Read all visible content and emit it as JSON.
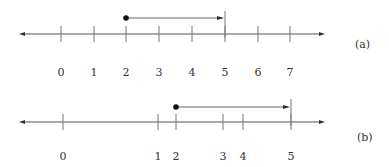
{
  "diagram": {
    "colors": {
      "line": "#555555",
      "tick": "#777777",
      "text": "#333333",
      "dot": "#111111"
    },
    "number_lines": [
      {
        "id": "a",
        "caption": "(a)",
        "ticks": [
          {
            "value": 0,
            "label": "0"
          },
          {
            "value": 1,
            "label": "1"
          },
          {
            "value": 2,
            "label": "2"
          },
          {
            "value": 3,
            "label": "3"
          },
          {
            "value": 4,
            "label": "4"
          },
          {
            "value": 5,
            "label": "5"
          },
          {
            "value": 6,
            "label": "6"
          },
          {
            "value": 7,
            "label": "7"
          }
        ],
        "interval": {
          "start": 2,
          "end": 5,
          "start_closed": true,
          "end_marker": "bar"
        }
      },
      {
        "id": "b",
        "caption": "(b)",
        "ticks": [
          {
            "value": 0,
            "label": "0"
          },
          {
            "value": 1,
            "label": "1"
          },
          {
            "value": 2,
            "label": "2"
          },
          {
            "value": 3,
            "label": "3"
          },
          {
            "value": 4,
            "label": "4"
          },
          {
            "value": 5,
            "label": "5"
          }
        ],
        "interval": {
          "start": 2,
          "end": 5,
          "start_closed": true,
          "end_marker": "bar"
        }
      }
    ]
  }
}
